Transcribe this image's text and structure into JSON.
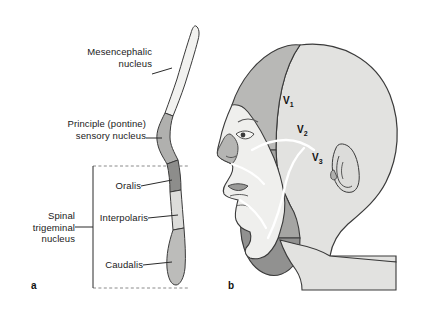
{
  "figure": {
    "background": "#ffffff"
  },
  "panel_a": {
    "letter": "a",
    "caption": "Trigeminal sensory nuclear column in the brainstem",
    "labels": {
      "mesencephalic": "Mesencephalic\nnucleus",
      "principal": "Principle (pontine)\nsensory nucleus",
      "oralis": "Oralis",
      "interpolaris": "Interpolaris",
      "caudalis": "Caudalis",
      "spinal": "Spinal\ntrigeminal\nnucleus"
    },
    "segments": [
      {
        "name": "mesencephalic-nucleus",
        "label": "Mesencephalic nucleus",
        "fill": "#f2f2f0"
      },
      {
        "name": "principal-sensory-nucleus",
        "label": "Principle (pontine) sensory nucleus",
        "fill": "#b0b0ae"
      },
      {
        "name": "oralis",
        "label": "Oralis",
        "fill": "#8d8d8b"
      },
      {
        "name": "interpolaris",
        "label": "Interpolaris",
        "fill": "#dcdcda"
      },
      {
        "name": "caudalis",
        "label": "Caudalis",
        "fill": "#bcbcba"
      }
    ],
    "bracket": {
      "name": "spinal-trigeminal-bracket",
      "label": "Spinal trigeminal nucleus",
      "style": "dashed-top-and-bottom"
    }
  },
  "panel_b": {
    "letter": "b",
    "caption": "Lateral view of head showing trigeminal dermatomes",
    "dermatomes": [
      {
        "name": "v1",
        "label": "V",
        "subscript": "1",
        "region": "ophthalmic",
        "fill": "#b8b8b6"
      },
      {
        "name": "v2",
        "label": "V",
        "subscript": "2",
        "region": "maxillary",
        "fill": "#a5a5a3"
      },
      {
        "name": "v3",
        "label": "V",
        "subscript": "3",
        "region": "mandibular",
        "fill": "#919190"
      }
    ],
    "anatomy": [
      "scalp-posterior",
      "ear",
      "eye",
      "nose",
      "lips",
      "chin",
      "neck"
    ]
  },
  "colors": {
    "outline": "#3a3a3a",
    "divider_white": "#ffffff",
    "scalp_posterior": "#e2e2e0",
    "text": "#1a1a1a"
  }
}
